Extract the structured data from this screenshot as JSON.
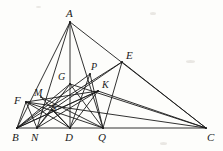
{
  "figure": {
    "width": 223,
    "height": 151,
    "stroke_color": "#1b1b1b",
    "background_color": "#fdfdfb",
    "label_color": "#1a1a1a"
  },
  "points": [
    {
      "id": "A",
      "label": "A",
      "x": 70,
      "y": 22,
      "label_x": 66,
      "label_y": 8,
      "role": "apex-vertex"
    },
    {
      "id": "B",
      "label": "B",
      "x": 17,
      "y": 128,
      "label_x": 12,
      "label_y": 132,
      "role": "base-vertex"
    },
    {
      "id": "C",
      "label": "C",
      "x": 206,
      "y": 128,
      "label_x": 207,
      "label_y": 132,
      "role": "base-vertex"
    },
    {
      "id": "N",
      "label": "N",
      "x": 37,
      "y": 128,
      "label_x": 31,
      "label_y": 132,
      "role": "base-point"
    },
    {
      "id": "D",
      "label": "D",
      "x": 70,
      "y": 128,
      "label_x": 65,
      "label_y": 132,
      "role": "base-point"
    },
    {
      "id": "Q",
      "label": "Q",
      "x": 103,
      "y": 128,
      "label_x": 98,
      "label_y": 132,
      "role": "base-point"
    },
    {
      "id": "E",
      "label": "E",
      "x": 122,
      "y": 62,
      "label_x": 126,
      "label_y": 50,
      "role": "side-point"
    },
    {
      "id": "F",
      "label": "F",
      "x": 26,
      "y": 102,
      "label_x": 14,
      "label_y": 95,
      "role": "side-point"
    },
    {
      "id": "P",
      "label": "P",
      "x": 90,
      "y": 74,
      "label_x": 91,
      "label_y": 62,
      "role": "intersection"
    },
    {
      "id": "G",
      "label": "G",
      "x": 70,
      "y": 84,
      "label_x": 58,
      "label_y": 72,
      "role": "intersection"
    },
    {
      "id": "K",
      "label": "K",
      "x": 98,
      "y": 91,
      "label_x": 102,
      "label_y": 80,
      "role": "intersection"
    },
    {
      "id": "M",
      "label": "M",
      "x": 41,
      "y": 97,
      "label_x": 34,
      "label_y": 88,
      "role": "intersection"
    },
    {
      "id": "S",
      "label": "S",
      "x": 52,
      "y": 110,
      "label_x": 51,
      "label_y": 103,
      "role": "intersection"
    }
  ],
  "segments": [
    {
      "name": "side-AB",
      "from": "A",
      "to": "B"
    },
    {
      "name": "side-AC",
      "from": "A",
      "to": "C"
    },
    {
      "name": "base-BC",
      "from": "B",
      "to": "C"
    },
    {
      "name": "cevian-AN",
      "from": "A",
      "to": "N"
    },
    {
      "name": "cevian-AD",
      "from": "A",
      "to": "D"
    },
    {
      "name": "cevian-AQ",
      "from": "A",
      "to": "Q"
    },
    {
      "name": "segment-BE",
      "from": "B",
      "to": "E"
    },
    {
      "name": "segment-BP",
      "from": "B",
      "to": "P"
    },
    {
      "name": "segment-BK",
      "from": "B",
      "to": "K"
    },
    {
      "name": "segment-EQ",
      "from": "E",
      "to": "Q"
    },
    {
      "name": "segment-EC",
      "from": "E",
      "to": "C"
    },
    {
      "name": "segment-KC",
      "from": "K",
      "to": "C"
    },
    {
      "name": "segment-KD",
      "from": "K",
      "to": "D"
    },
    {
      "name": "segment-KN",
      "from": "K",
      "to": "N"
    },
    {
      "name": "segment-KB",
      "from": "K",
      "to": "B"
    },
    {
      "name": "segment-FC",
      "from": "F",
      "to": "C"
    },
    {
      "name": "segment-FD",
      "from": "F",
      "to": "D"
    },
    {
      "name": "segment-FQ",
      "from": "F",
      "to": "Q"
    },
    {
      "name": "segment-FK",
      "from": "F",
      "to": "K"
    },
    {
      "name": "segment-FN",
      "from": "F",
      "to": "N"
    },
    {
      "name": "segment-FB",
      "from": "F",
      "to": "B"
    },
    {
      "name": "segment-GC",
      "from": "G",
      "to": "C"
    },
    {
      "name": "segment-GN",
      "from": "G",
      "to": "N"
    },
    {
      "name": "segment-GB",
      "from": "G",
      "to": "B"
    },
    {
      "name": "segment-GQ",
      "from": "G",
      "to": "Q"
    },
    {
      "name": "segment-MD",
      "from": "M",
      "to": "D"
    },
    {
      "name": "segment-MQ",
      "from": "M",
      "to": "Q"
    },
    {
      "name": "segment-SE",
      "from": "S",
      "to": "E"
    },
    {
      "name": "segment-SN",
      "from": "S",
      "to": "N"
    },
    {
      "name": "segment-SD",
      "from": "S",
      "to": "D"
    },
    {
      "name": "segment-PD",
      "from": "P",
      "to": "D"
    },
    {
      "name": "segment-PQ",
      "from": "P",
      "to": "Q"
    }
  ]
}
